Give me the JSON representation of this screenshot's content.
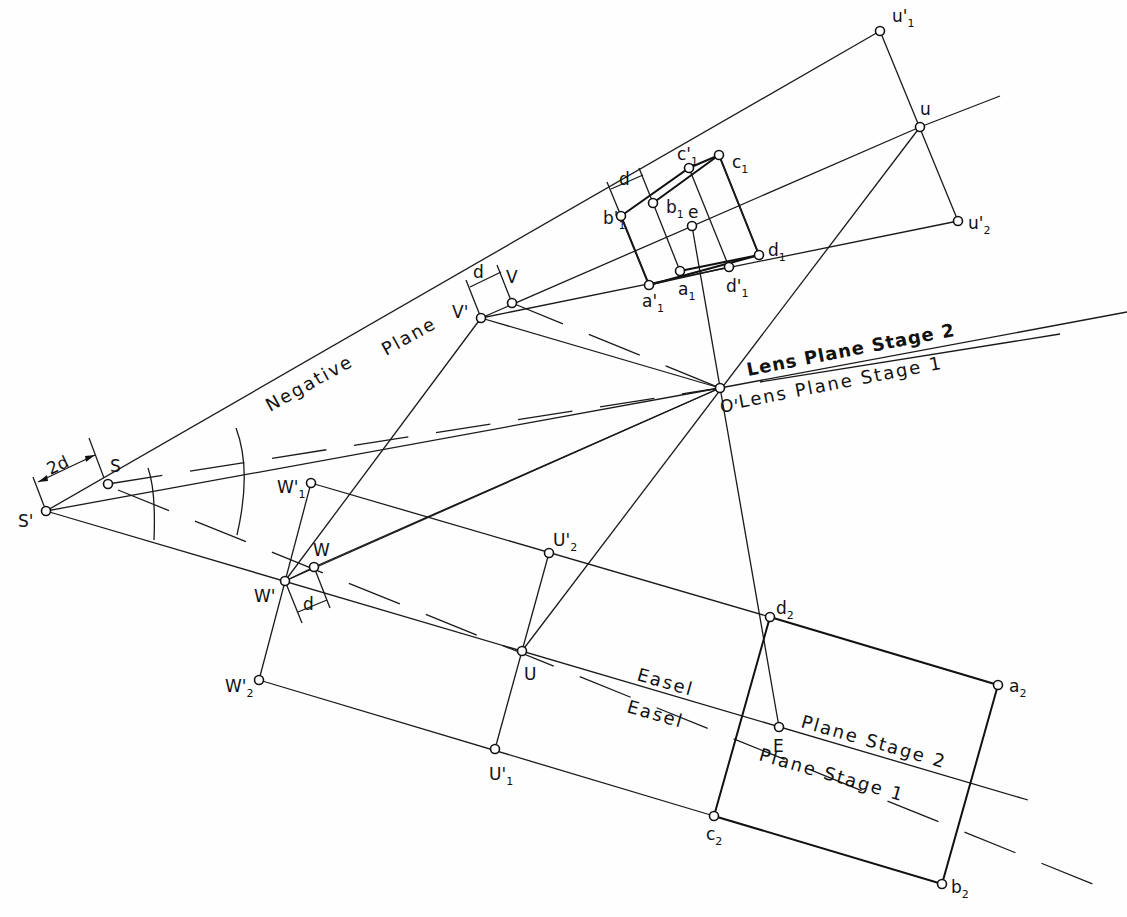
{
  "diagram": {
    "points": [
      {
        "id": "S_prime",
        "x": 46,
        "y": 511,
        "label": "S",
        "prime": "'",
        "sub": "",
        "lx": 18,
        "ly": 527
      },
      {
        "id": "S",
        "x": 108,
        "y": 484,
        "label": "S",
        "prime": "",
        "sub": "",
        "lx": 110,
        "ly": 472
      },
      {
        "id": "V_prime",
        "x": 481,
        "y": 318,
        "label": "V",
        "prime": "'",
        "sub": "",
        "lx": 452,
        "ly": 318
      },
      {
        "id": "V",
        "x": 512,
        "y": 303,
        "label": "V",
        "prime": "",
        "sub": "",
        "lx": 506,
        "ly": 283
      },
      {
        "id": "O_prime",
        "x": 720,
        "y": 388,
        "label": "O",
        "prime": "'",
        "sub": "",
        "lx": 720,
        "ly": 412
      },
      {
        "id": "W1_prime",
        "x": 311,
        "y": 483,
        "label": "W",
        "prime": "'",
        "sub": "1",
        "lx": 277,
        "ly": 493
      },
      {
        "id": "W",
        "x": 314,
        "y": 567,
        "label": "W",
        "prime": "",
        "sub": "",
        "lx": 313,
        "ly": 556
      },
      {
        "id": "W_prime",
        "x": 285,
        "y": 581,
        "label": "W",
        "prime": "'",
        "sub": "",
        "lx": 254,
        "ly": 602
      },
      {
        "id": "W2_prime",
        "x": 259,
        "y": 680,
        "label": "W",
        "prime": "'",
        "sub": "2",
        "lx": 225,
        "ly": 692
      },
      {
        "id": "U2_prime",
        "x": 549,
        "y": 553,
        "label": "U",
        "prime": "'",
        "sub": "2",
        "lx": 553,
        "ly": 546
      },
      {
        "id": "U",
        "x": 522,
        "y": 651,
        "label": "U",
        "prime": "",
        "sub": "",
        "lx": 524,
        "ly": 680
      },
      {
        "id": "U1_prime",
        "x": 495,
        "y": 749,
        "label": "U",
        "prime": "'",
        "sub": "1",
        "lx": 489,
        "ly": 780
      },
      {
        "id": "u1_prime",
        "x": 880,
        "y": 31,
        "label": "u",
        "prime": "'",
        "sub": "1",
        "lx": 892,
        "ly": 22
      },
      {
        "id": "u",
        "x": 920,
        "y": 127,
        "label": "u",
        "prime": "",
        "sub": "",
        "lx": 920,
        "ly": 115
      },
      {
        "id": "u2_prime",
        "x": 958,
        "y": 221,
        "label": "u",
        "prime": "'",
        "sub": "2",
        "lx": 968,
        "ly": 229
      },
      {
        "id": "c1_prime",
        "x": 689,
        "y": 168,
        "label": "c",
        "prime": "'",
        "sub": "1",
        "lx": 677,
        "ly": 160
      },
      {
        "id": "c1",
        "x": 719,
        "y": 155,
        "label": "c",
        "prime": "",
        "sub": "1",
        "lx": 732,
        "ly": 168
      },
      {
        "id": "b1_prime",
        "x": 621,
        "y": 216,
        "label": "b",
        "prime": "'",
        "sub": "1",
        "lx": 603,
        "ly": 224
      },
      {
        "id": "b1",
        "x": 653,
        "y": 203,
        "label": "b",
        "prime": "",
        "sub": "1",
        "lx": 666,
        "ly": 213
      },
      {
        "id": "e",
        "x": 692,
        "y": 226,
        "label": "e",
        "prime": "",
        "sub": "",
        "lx": 688,
        "ly": 218
      },
      {
        "id": "d1",
        "x": 759,
        "y": 255,
        "label": "d",
        "prime": "",
        "sub": "1",
        "lx": 768,
        "ly": 256
      },
      {
        "id": "a1_prime",
        "x": 649,
        "y": 285,
        "label": "a",
        "prime": "'",
        "sub": "1",
        "lx": 642,
        "ly": 307
      },
      {
        "id": "a1",
        "x": 680,
        "y": 271,
        "label": "a",
        "prime": "",
        "sub": "1",
        "lx": 678,
        "ly": 295
      },
      {
        "id": "d1_prime",
        "x": 729,
        "y": 267,
        "label": "d",
        "prime": "'",
        "sub": "1",
        "lx": 726,
        "ly": 292
      },
      {
        "id": "d2",
        "x": 770,
        "y": 617,
        "label": "d",
        "prime": "",
        "sub": "2",
        "lx": 776,
        "ly": 614
      },
      {
        "id": "a2",
        "x": 998,
        "y": 685,
        "label": "a",
        "prime": "",
        "sub": "2",
        "lx": 1009,
        "ly": 692
      },
      {
        "id": "E",
        "x": 779,
        "y": 727,
        "label": "E",
        "prime": "",
        "sub": "",
        "lx": 773,
        "ly": 752
      },
      {
        "id": "c2",
        "x": 714,
        "y": 816,
        "label": "c",
        "prime": "",
        "sub": "2",
        "lx": 706,
        "ly": 840
      },
      {
        "id": "b2",
        "x": 942,
        "y": 884,
        "label": "b",
        "prime": "",
        "sub": "2",
        "lx": 951,
        "ly": 893
      }
    ],
    "plane_labels": {
      "negative": "Negative",
      "negative_plane": "Plane",
      "lens_stage2": "Lens Plane Stage 2",
      "lens_stage1": "Lens Plane Stage 1",
      "easel_stage2": "Easel",
      "easel_stage1": "Easel",
      "plane_stage2": "Plane Stage 2",
      "plane_stage1": "Plane Stage 1"
    },
    "dimensions": {
      "two_d": "2d",
      "d_top": "d",
      "d_v": "d",
      "d_w": "d"
    }
  }
}
